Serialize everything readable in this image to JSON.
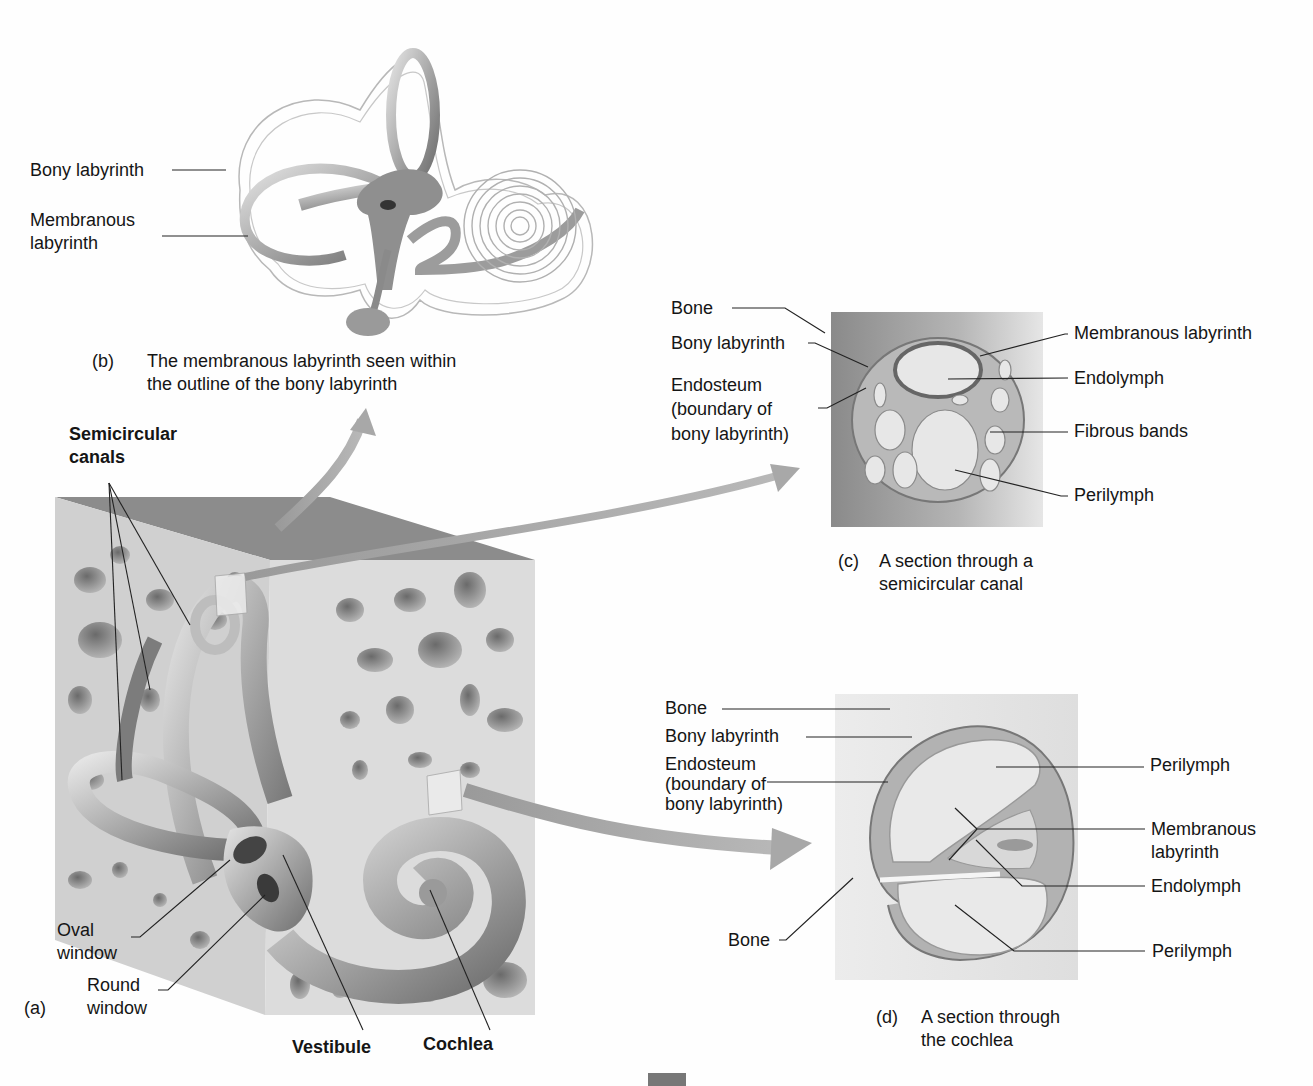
{
  "figure": {
    "panel_a": {
      "tag": "(a)",
      "labels": {
        "semicircular_canals_1": "Semicircular",
        "semicircular_canals_2": "canals",
        "oval_window_1": "Oval",
        "oval_window_2": "window",
        "round_window_1": "Round",
        "round_window_2": "window",
        "vestibule": "Vestibule",
        "cochlea": "Cochlea"
      }
    },
    "panel_b": {
      "tag": "(b)",
      "caption_line1": "The membranous labyrinth seen within",
      "caption_line2": "the outline of the bony labyrinth",
      "labels": {
        "bony_labyrinth": "Bony labyrinth",
        "membranous_labyrinth_1": "Membranous",
        "membranous_labyrinth_2": "labyrinth"
      }
    },
    "panel_c": {
      "tag": "(c)",
      "caption_line1": "A section through a",
      "caption_line2": "semicircular canal",
      "labels": {
        "bone": "Bone",
        "bony_labyrinth": "Bony labyrinth",
        "endosteum_1": "Endosteum",
        "endosteum_2": "(boundary of",
        "endosteum_3": "bony labyrinth)",
        "membranous_labyrinth": "Membranous labyrinth",
        "endolymph": "Endolymph",
        "fibrous_bands": "Fibrous bands",
        "perilymph": "Perilymph"
      }
    },
    "panel_d": {
      "tag": "(d)",
      "caption_line1": "A section through",
      "caption_line2": "the cochlea",
      "labels": {
        "bone_top": "Bone",
        "bony_labyrinth": "Bony labyrinth",
        "endosteum_1": "Endosteum",
        "endosteum_2": "(boundary of",
        "endosteum_3": "bony labyrinth)",
        "perilymph_top": "Perilymph",
        "membranous_labyrinth_1": "Membranous",
        "membranous_labyrinth_2": "labyrinth",
        "endolymph": "Endolymph",
        "bone_bottom": "Bone",
        "perilymph_bottom": "Perilymph"
      }
    }
  },
  "colors": {
    "background": "#fefefe",
    "bone_block": "#d6d6d6",
    "bone_top_face": "#8e8e8e",
    "labyrinth_tube": "#a9a9a9",
    "arrow": "#a0a0a0",
    "leader_line": "#222222"
  }
}
